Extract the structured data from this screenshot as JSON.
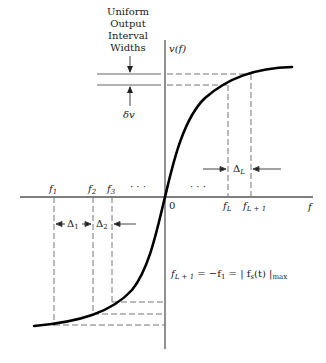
{
  "figure": {
    "annotation_title": [
      "Uniform",
      "Output",
      "Interval",
      "Widths"
    ],
    "y_axis_label": "v(f)",
    "x_axis_label": "f",
    "origin_label": "0",
    "delta_v_label": "δv",
    "ellipsis": "· · ·",
    "x_ticks": [
      {
        "base": "f",
        "sub": "1"
      },
      {
        "base": "f",
        "sub": "2"
      },
      {
        "base": "f",
        "sub": "3"
      },
      {
        "base": "f",
        "sub": "L"
      },
      {
        "base": "f",
        "sub": "L + 1"
      }
    ],
    "intervals": [
      {
        "base": "Δ",
        "sub": "1"
      },
      {
        "base": "Δ",
        "sub": "2"
      },
      {
        "base": "Δ",
        "sub": "L"
      }
    ],
    "equation": {
      "lhs_base": "f",
      "lhs_sub": "L + 1",
      "mid": " = −f",
      "mid_sub": "1",
      "rhs": " = | f",
      "rhs_sub": "s",
      "rhs_tail": "(t) |",
      "rhs_sub2": "max"
    },
    "colors": {
      "ink": "#1a1a1a",
      "axis": "#555555",
      "dash": "#777777",
      "curve": "#000000"
    }
  }
}
